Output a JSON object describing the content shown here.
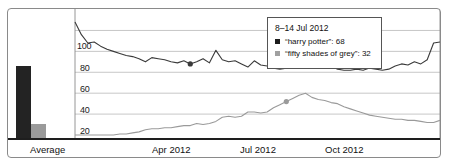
{
  "chart_data": {
    "type": "line",
    "title": "",
    "xlabel": "",
    "ylabel": "",
    "ylim": [
      0,
      110
    ],
    "grid": true,
    "yticks": [
      20,
      40,
      60,
      80,
      100
    ],
    "xticks": [
      "Average",
      "Apr 2012",
      "Jul 2012",
      "Oct 2012"
    ],
    "series": [
      {
        "name": "harry potter",
        "color": "#3a3a3a",
        "average": 76,
        "highlight_value": 68,
        "values": [
          108,
          96,
          88,
          89,
          85,
          82,
          80,
          78,
          76,
          75,
          73,
          70,
          74,
          73,
          72,
          70,
          69,
          71,
          68,
          70,
          73,
          69,
          81,
          72,
          70,
          71,
          68,
          65,
          71,
          67,
          66,
          64,
          63,
          64,
          66,
          72,
          70,
          73,
          70,
          68,
          66,
          63,
          62,
          62,
          63,
          62,
          64,
          63,
          62,
          63,
          66,
          68,
          67,
          70,
          68,
          72,
          88,
          89
        ]
      },
      {
        "name": "fifty shades of grey",
        "color": "#9a9a9a",
        "average": 13,
        "highlight_value": 32,
        "values": [
          0,
          0,
          0,
          0,
          0,
          0,
          0,
          1,
          1,
          2,
          3,
          5,
          6,
          6,
          7,
          7,
          8,
          9,
          9,
          11,
          10,
          11,
          13,
          17,
          18,
          17,
          18,
          22,
          22,
          21,
          22,
          26,
          29,
          32,
          35,
          38,
          40,
          36,
          34,
          33,
          31,
          30,
          27,
          25,
          23,
          21,
          19,
          18,
          17,
          16,
          15,
          15,
          14,
          14,
          13,
          12,
          12,
          14
        ]
      }
    ]
  },
  "axis": {
    "y_labels": [
      "100",
      "80",
      "60",
      "40",
      "20"
    ],
    "x_labels": [
      {
        "text": "Average",
        "left": 60
      },
      {
        "text": "Apr 2012",
        "left": 152
      },
      {
        "text": "Jul 2012",
        "left": 240
      },
      {
        "text": "Oct 2012",
        "left": 325
      }
    ]
  },
  "tooltip": {
    "date_range": "8–14 Jul 2012",
    "rows": [
      {
        "label": "“harry potter”: 68",
        "swatch": "dark"
      },
      {
        "label": "“fifty shades of grey”: 32",
        "swatch": "grey"
      }
    ]
  },
  "average_bars": [
    {
      "name": "harry potter",
      "value": 76,
      "color": "#232323"
    },
    {
      "name": "fifty shades of grey",
      "value": 13,
      "color": "#9a9a9a"
    }
  ]
}
